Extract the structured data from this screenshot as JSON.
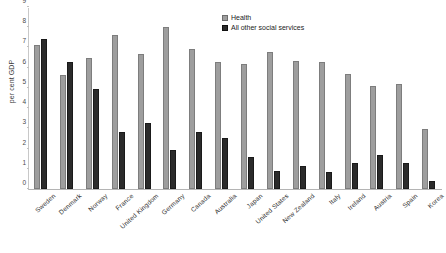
{
  "chart_data": {
    "type": "bar",
    "title": "",
    "xlabel": "",
    "ylabel": "per cent GDP",
    "ylim": [
      0,
      9
    ],
    "yticks": [
      0,
      1,
      2,
      3,
      4,
      5,
      6,
      7,
      8,
      9
    ],
    "grid": false,
    "legend_position": "top-center",
    "categories": [
      "Sweden",
      "Denmark",
      "Norway",
      "France",
      "United Kingdom",
      "Germany",
      "Canada",
      "Australia",
      "Japan",
      "United States",
      "New Zealand",
      "Italy",
      "Ireland",
      "Austria",
      "Spain",
      "Korea"
    ],
    "series": [
      {
        "name": "Health",
        "color": "#9e9e9e",
        "values": [
          7.1,
          5.65,
          6.5,
          7.6,
          6.7,
          8.0,
          6.9,
          6.3,
          6.2,
          6.8,
          6.35,
          6.3,
          5.7,
          5.1,
          5.2,
          2.95
        ]
      },
      {
        "name": "All other social services",
        "color": "#2b2b2b",
        "values": [
          7.4,
          6.3,
          4.95,
          2.8,
          3.25,
          1.95,
          2.8,
          2.5,
          1.6,
          0.9,
          1.15,
          0.85,
          1.3,
          1.7,
          1.3,
          0.4
        ]
      }
    ]
  },
  "legend": {
    "items": [
      {
        "label": "Health"
      },
      {
        "label": "All other social services"
      }
    ]
  },
  "axis": {
    "y_label": "per cent GDP"
  }
}
